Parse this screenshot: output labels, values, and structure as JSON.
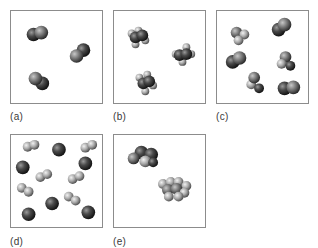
{
  "figure": {
    "panels": [
      {
        "id": "a",
        "label": "(a)",
        "description": "Three diatomic molecules of identical dark atoms (homonuclear diatomic element)"
      },
      {
        "id": "b",
        "label": "(b)",
        "description": "Three molecules, each a dark central cluster with light small atoms (polyatomic compound)"
      },
      {
        "id": "c",
        "label": "(c)",
        "description": "Mixture of diatomic dark molecules and molecules with light atoms"
      },
      {
        "id": "d",
        "label": "(d)",
        "description": "Mixture of single dark atoms and light diatomic molecules"
      },
      {
        "id": "e",
        "label": "(e)",
        "description": "Two larger molecules: one dark cluster and one light multi-atom cluster"
      }
    ]
  },
  "colors": {
    "border": "#8c8c8c",
    "dark_atom": "#3a3a3a",
    "light_atom": "#b8b8b8",
    "label": "#3a3a3a"
  }
}
